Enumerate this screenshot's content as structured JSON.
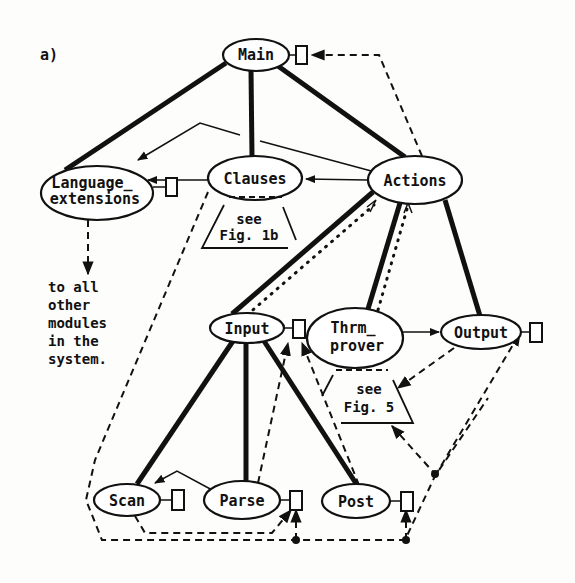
{
  "figure_label": "a)",
  "nodes": {
    "main": {
      "label": "Main"
    },
    "language_extensions": {
      "line1": "Language_",
      "line2": "extensions"
    },
    "clauses": {
      "label": "Clauses",
      "note_line1": "see",
      "note_line2": "Fig. 1b"
    },
    "actions": {
      "label": "Actions"
    },
    "input": {
      "label": "Input"
    },
    "thrm_prover": {
      "line1": "Thrm_",
      "line2": "prover",
      "note_line1": "see",
      "note_line2": "Fig. 5"
    },
    "output": {
      "label": "Output"
    },
    "scan": {
      "label": "Scan"
    },
    "parse": {
      "label": "Parse"
    },
    "post": {
      "label": "Post"
    }
  },
  "annotation": {
    "lines": [
      "to all",
      "other",
      "modules",
      "in the",
      "system."
    ]
  },
  "edges": {
    "hierarchy": [
      [
        "Main",
        "Language_extensions"
      ],
      [
        "Main",
        "Clauses"
      ],
      [
        "Main",
        "Actions"
      ],
      [
        "Actions",
        "Input"
      ],
      [
        "Actions",
        "Thrm_prover"
      ],
      [
        "Actions",
        "Output"
      ],
      [
        "Input",
        "Scan"
      ],
      [
        "Input",
        "Parse"
      ],
      [
        "Input",
        "Post"
      ]
    ],
    "calls": [
      [
        "Actions",
        "Clauses"
      ],
      [
        "Clauses",
        "Language_extensions"
      ],
      [
        "Actions",
        "Language_extensions"
      ],
      [
        "Thrm_prover",
        "Output"
      ],
      [
        "Parse",
        "Scan"
      ]
    ],
    "data_flow_dotted": [
      [
        "Input",
        "Actions"
      ],
      [
        "Thrm_prover",
        "Actions"
      ]
    ]
  }
}
